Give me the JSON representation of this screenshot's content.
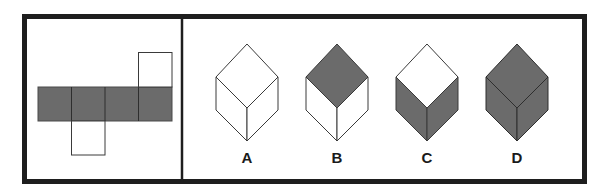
{
  "puzzle": {
    "type": "cube-net-folding",
    "colors": {
      "frame": "#1e1e1e",
      "shaded": "#6b6b6b",
      "unshaded": "#ffffff",
      "line": "#3a3a3a"
    },
    "net": {
      "description": "Cross-shaped net: row of 4 shaded squares, one white square above the 4th, one white square below the 2nd",
      "row_squares": [
        "shaded",
        "shaded",
        "shaded",
        "shaded"
      ],
      "top_flap": {
        "column": 4,
        "fill": "unshaded"
      },
      "bottom_flap": {
        "column": 2,
        "fill": "unshaded"
      }
    },
    "options": [
      {
        "label": "A",
        "top": "unshaded",
        "left": "unshaded",
        "right": "unshaded"
      },
      {
        "label": "B",
        "top": "shaded",
        "left": "unshaded",
        "right": "unshaded"
      },
      {
        "label": "C",
        "top": "unshaded",
        "left": "shaded",
        "right": "shaded"
      },
      {
        "label": "D",
        "top": "shaded",
        "left": "shaded",
        "right": "shaded"
      }
    ]
  }
}
